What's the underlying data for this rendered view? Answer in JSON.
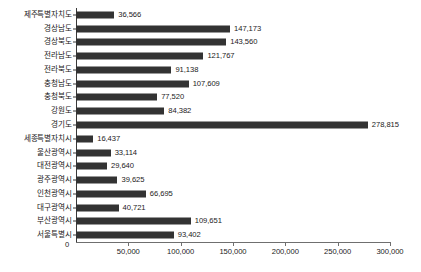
{
  "chart_data": {
    "type": "bar",
    "orientation": "horizontal",
    "title": "",
    "subtitle": "",
    "xlabel": "",
    "ylabel": "",
    "xlim": [
      0,
      300000
    ],
    "grid": false,
    "legend": null,
    "xticks": [
      0,
      50000,
      100000,
      150000,
      200000,
      250000,
      300000
    ],
    "xtick_labels": [
      "0",
      "50,000",
      "100,000",
      "150,000",
      "200,000",
      "250,000",
      "300,000"
    ],
    "categories": [
      "제주특별자치도",
      "경상남도",
      "경상북도",
      "전라남도",
      "전라북도",
      "충청남도",
      "충청북도",
      "강원도",
      "경기도",
      "세종특별자치시",
      "울산광역시",
      "대전광역시",
      "광주광역시",
      "인천광역시",
      "대구광역시",
      "부산광역시",
      "서울특별시"
    ],
    "values": [
      36566,
      147173,
      143560,
      121767,
      91138,
      107609,
      77520,
      84382,
      278815,
      16437,
      33114,
      29640,
      39625,
      66695,
      40721,
      109651,
      93402
    ],
    "value_labels": [
      "36,566",
      "147,173",
      "143,560",
      "121,767",
      "91,138",
      "107,609",
      "77,520",
      "84,382",
      "278,815",
      "16,437",
      "33,114",
      "29,640",
      "39,625",
      "66,695",
      "40,721",
      "109,651",
      "93,402"
    ],
    "bar_color": "#333333",
    "axis_color": "#6f6f6f",
    "text_color": "#1a1a1a",
    "background": "#ffffff"
  }
}
